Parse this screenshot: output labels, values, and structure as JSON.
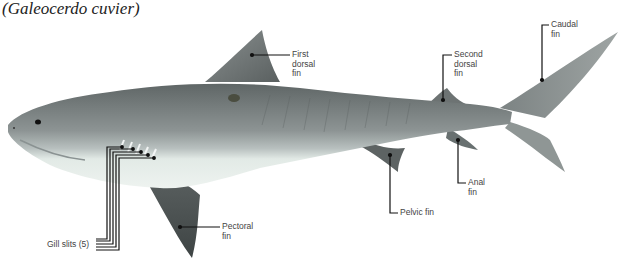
{
  "title": {
    "common_name": "Tiger shark",
    "scientific_name": "(Galeocerdo cuvier)"
  },
  "labels": {
    "first_dorsal": "First\ndorsal\nfin",
    "first_dorsal_l1": "First",
    "first_dorsal_l2": "dorsal",
    "first_dorsal_l3": "fin",
    "second_dorsal_l1": "Second",
    "second_dorsal_l2": "dorsal",
    "second_dorsal_l3": "fin",
    "caudal_l1": "Caudal",
    "caudal_l2": "fin",
    "anal_l1": "Anal",
    "anal_l2": "fin",
    "pelvic": "Pelvic fin",
    "pectoral_l1": "Pectoral",
    "pectoral_l2": "fin",
    "gill_slits": "Gill slits (5)"
  },
  "colors": {
    "body_dark": "#6e7474",
    "body_mid": "#9aa0a0",
    "belly": "#e4ece8",
    "fin_dark": "#4c5252",
    "leader_line": "#111111",
    "label_text": "#444444"
  }
}
